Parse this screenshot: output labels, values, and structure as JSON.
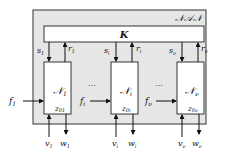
{
  "system": {
    "label": "𝒩𝒜𝒩",
    "background": "#e6e6e6"
  },
  "controller": {
    "label": "K"
  },
  "subsystems": [
    {
      "label": "𝒩",
      "sub": "1",
      "s": "s",
      "s_sub": "1",
      "r": "r",
      "r_sub": "1",
      "f": "f",
      "f_sub": "1",
      "z": "z",
      "z_sub": "01",
      "v": "v",
      "v_sub": "1",
      "w": "w",
      "w_sub": "1"
    },
    {
      "label": "𝒩",
      "sub": "i",
      "s": "s",
      "s_sub": "i",
      "r": "r",
      "r_sub": "i",
      "f": "f",
      "f_sub": "i",
      "z": "z",
      "z_sub": "0i",
      "v": "v",
      "v_sub": "i",
      "w": "w",
      "w_sub": "i"
    },
    {
      "label": "𝒩",
      "sub": "ν",
      "s": "s",
      "s_sub": "ν",
      "r": "r",
      "r_sub": "ν",
      "f": "f",
      "f_sub": "ν",
      "z": "z",
      "z_sub": "0ν",
      "v": "v",
      "v_sub": "ν",
      "w": "w",
      "w_sub": "ν"
    }
  ],
  "ellipsis": "···"
}
